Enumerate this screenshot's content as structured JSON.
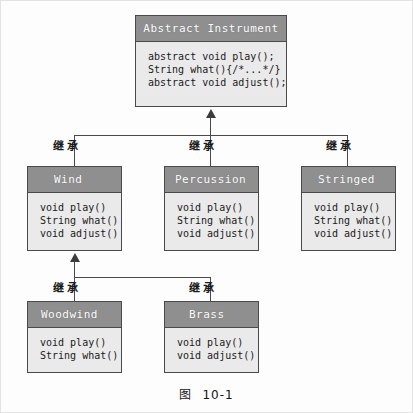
{
  "diagram": {
    "caption_label": "图",
    "caption_number": "10-1",
    "edge_label": "继承",
    "colors": {
      "header_fill": "#8f8f8f",
      "body_fill": "#eaeaea",
      "border": "#4a4a4a",
      "header_text": "#ffffff",
      "body_text": "#1a1a1a",
      "page_bg": "#fdfdfd"
    },
    "classes": {
      "abstract_instrument": {
        "name": "Abstract Instrument",
        "members": [
          "abstract void play();",
          "String what(){/*...*/}",
          "abstract void adjust();"
        ]
      },
      "wind": {
        "name": "Wind",
        "members": [
          "void play()",
          "String what()",
          "void adjust()"
        ]
      },
      "percussion": {
        "name": "Percussion",
        "members": [
          "void play()",
          "String what()",
          "void adjust()"
        ]
      },
      "stringed": {
        "name": "Stringed",
        "members": [
          "void play()",
          "String what()",
          "void adjust()"
        ]
      },
      "woodwind": {
        "name": "Woodwind",
        "members": [
          "void play()",
          "String what()"
        ]
      },
      "brass": {
        "name": "Brass",
        "members": [
          "void play()",
          "void adjust()"
        ]
      }
    },
    "edges": [
      {
        "from": "Wind",
        "to": "Abstract Instrument",
        "label": "继承"
      },
      {
        "from": "Percussion",
        "to": "Abstract Instrument",
        "label": "继承"
      },
      {
        "from": "Stringed",
        "to": "Abstract Instrument",
        "label": "继承"
      },
      {
        "from": "Woodwind",
        "to": "Wind",
        "label": "继承"
      },
      {
        "from": "Brass",
        "to": "Wind",
        "label": "继承"
      }
    ]
  }
}
